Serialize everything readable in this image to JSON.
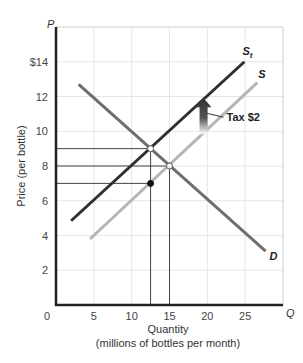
{
  "chart_data": {
    "type": "line",
    "title": "",
    "xlabel": "Quantity",
    "xlabel_sub": "(millions of bottles per month)",
    "ylabel": "Price (per bottle)",
    "x_axis_symbol": "Q",
    "y_axis_symbol": "P",
    "xlim": [
      0,
      30
    ],
    "ylim": [
      0,
      16
    ],
    "x_ticks": [
      0,
      5,
      10,
      15,
      20,
      25
    ],
    "x_tick_labels": [
      "0",
      "5",
      "10",
      "15",
      "20",
      "25"
    ],
    "y_ticks": [
      2,
      4,
      6,
      8,
      10,
      12,
      14
    ],
    "y_tick_labels": [
      "2",
      "4",
      "6",
      "8",
      "10",
      "12",
      "$14"
    ],
    "grid": true,
    "series": [
      {
        "name": "D",
        "label": "D",
        "color": "#6e6e6e",
        "points": [
          [
            3,
            12.7
          ],
          [
            27.7,
            3.1
          ]
        ]
      },
      {
        "name": "S",
        "label": "S",
        "color": "#b5b5b5",
        "points": [
          [
            4.5,
            3.8
          ],
          [
            26.6,
            12.8
          ]
        ]
      },
      {
        "name": "S1",
        "label": "S",
        "label_sub": "t",
        "color": "#2f2f2f",
        "points": [
          [
            2,
            4.85
          ],
          [
            24.9,
            14
          ]
        ]
      }
    ],
    "markers": [
      {
        "name": "buyer-price-point",
        "q": 12.5,
        "p": 9,
        "style": "open"
      },
      {
        "name": "original-equilibrium-point",
        "q": 15,
        "p": 8,
        "style": "open"
      },
      {
        "name": "seller-price-point",
        "q": 12.5,
        "p": 7,
        "style": "filled"
      }
    ],
    "guide_lines": [
      {
        "type": "horizontal",
        "p": 9,
        "q_to": 12.5
      },
      {
        "type": "horizontal",
        "p": 8,
        "q_to": 15
      },
      {
        "type": "horizontal",
        "p": 7,
        "q_to": 12.5
      },
      {
        "type": "vertical",
        "q": 12.5,
        "p_from": 0,
        "p_to": 9
      },
      {
        "type": "vertical",
        "q": 15,
        "p_from": 0,
        "p_to": 8
      }
    ],
    "annotations": [
      {
        "text": "Tax $2",
        "arrow": "up",
        "q": 19.5,
        "p_from": 10.4,
        "p_to": 11.9
      }
    ]
  }
}
